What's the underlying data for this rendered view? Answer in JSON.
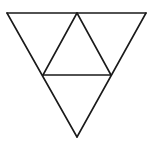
{
  "figure": {
    "stroke_color": "#1a1a1a",
    "background": "#ffffff",
    "stroke_width": 1.6,
    "vertices": {
      "top_left": [
        7,
        13
      ],
      "top_right": [
        146,
        13
      ],
      "bottom": [
        77,
        137
      ],
      "top_mid": [
        77,
        13
      ],
      "left_mid": [
        43,
        75
      ],
      "right_mid": [
        111,
        75
      ]
    },
    "triangle_count": 4
  }
}
